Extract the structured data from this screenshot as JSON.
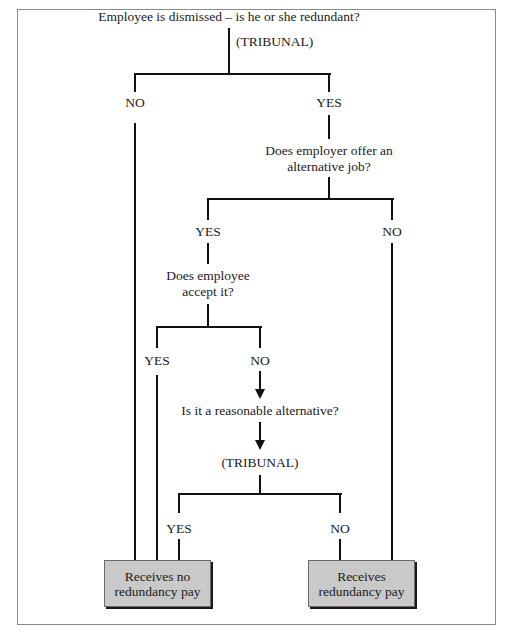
{
  "diagram": {
    "type": "decision-flowchart",
    "nodes": {
      "q1": "Employee is dismissed – is he or she redundant?",
      "q1_decider": "(TRIBUNAL)",
      "q1_no": "NO",
      "q1_yes": "YES",
      "q2_line1": "Does employer offer an",
      "q2_line2": "alternative job?",
      "q2_yes": "YES",
      "q2_no": "NO",
      "q3_line1": "Does employee",
      "q3_line2": "accept it?",
      "q3_yes": "YES",
      "q3_no": "NO",
      "q4": "Is it a reasonable alternative?",
      "q4_decider": "(TRIBUNAL)",
      "q4_yes": "YES",
      "q4_no": "NO"
    },
    "outcomes": {
      "no_pay_line1": "Receives no",
      "no_pay_line2": "redundancy pay",
      "pay_line1": "Receives",
      "pay_line2": "redundancy pay"
    },
    "edges": [
      {
        "from": "q1",
        "label": "NO",
        "to": "no_pay"
      },
      {
        "from": "q1",
        "label": "YES",
        "to": "q2"
      },
      {
        "from": "q2",
        "label": "YES",
        "to": "q3"
      },
      {
        "from": "q2",
        "label": "NO",
        "to": "pay"
      },
      {
        "from": "q3",
        "label": "YES",
        "to": "no_pay"
      },
      {
        "from": "q3",
        "label": "NO",
        "to": "q4"
      },
      {
        "from": "q4",
        "label": "YES",
        "to": "no_pay"
      },
      {
        "from": "q4",
        "label": "NO",
        "to": "pay"
      }
    ],
    "colors": {
      "line": "#111111",
      "outcome_fill": "#c9c9c9",
      "frame": "#8a8a8a"
    }
  }
}
